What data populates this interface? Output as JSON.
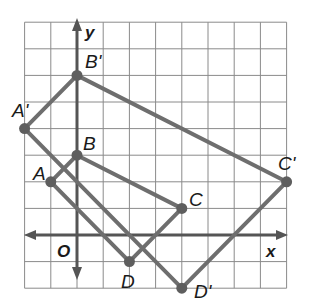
{
  "figure": {
    "axes": {
      "x_label": "x",
      "y_label": "y",
      "origin_label": "O"
    },
    "grid": {
      "x_min": -2,
      "x_max": 8,
      "y_min": -2,
      "y_max": 8
    },
    "colors": {
      "grid": "#8a8a8a",
      "axis": "#555555",
      "polygon": "#6e6e6e",
      "text": "#1a1a1a"
    },
    "original": {
      "name": "ABCD",
      "points": [
        {
          "label": "A",
          "x": -1,
          "y": 2
        },
        {
          "label": "B",
          "x": 0,
          "y": 3
        },
        {
          "label": "C",
          "x": 4,
          "y": 1
        },
        {
          "label": "D",
          "x": 2,
          "y": -1
        }
      ]
    },
    "image": {
      "name": "A'B'C'D'",
      "points": [
        {
          "label": "A'",
          "x": -2,
          "y": 4
        },
        {
          "label": "B'",
          "x": 0,
          "y": 6
        },
        {
          "label": "C'",
          "x": 8,
          "y": 2
        },
        {
          "label": "D'",
          "x": 4,
          "y": -2
        }
      ]
    }
  }
}
